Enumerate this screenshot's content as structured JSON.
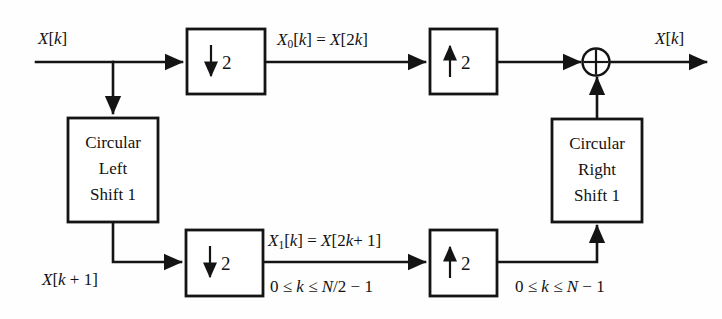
{
  "diagram": {
    "signals": {
      "input_label": "X[k]",
      "output_label": "X[k]",
      "branch_label": "X[k + 1]",
      "top_path_label": "X0[k] = X[2k]",
      "bottom_path_label": "X1[k] = X[2k + 1]",
      "bottom_range_label": "0 ≤ k ≤ N/2 − 1",
      "output_range_label": "0 ≤ k ≤ N − 1"
    },
    "blocks": [
      {
        "id": "downsampler-top",
        "name": "decimator-top",
        "arrow": "down",
        "factor": "2",
        "label": "↓ 2"
      },
      {
        "id": "circular-left-shift",
        "name": "circular-left-shift-block",
        "lines": [
          "Circular",
          "Left",
          "Shift 1"
        ]
      },
      {
        "id": "downsampler-bottom",
        "name": "decimator-bottom",
        "arrow": "down",
        "factor": "2",
        "label": "↓ 2"
      },
      {
        "id": "upsampler-top",
        "name": "interpolator-top",
        "arrow": "up",
        "factor": "2",
        "label": "↑ 2"
      },
      {
        "id": "upsampler-bottom",
        "name": "interpolator-bottom",
        "arrow": "up",
        "factor": "2",
        "label": "↑ 2"
      },
      {
        "id": "circular-right-shift",
        "name": "circular-right-shift-block",
        "lines": [
          "Circular",
          "Right",
          "Shift 1"
        ]
      }
    ],
    "summing_junction": {
      "symbol": "⊕",
      "name": "adder"
    },
    "colors": {
      "line": "#141414",
      "background": "#ffffff",
      "text": "#121212"
    }
  }
}
